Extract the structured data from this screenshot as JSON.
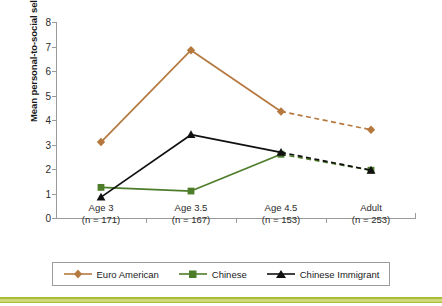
{
  "chart_data": {
    "type": "line",
    "title": "",
    "xlabel": "",
    "ylabel": "Mean personal-to-social self-description ratio",
    "categories": [
      "Age 3",
      "Age 3.5",
      "Age 4.5",
      "Adult"
    ],
    "category_sublabels": [
      "(n = 171)",
      "(n = 167)",
      "(n = 153)",
      "(n = 253)"
    ],
    "ylim": [
      0,
      8
    ],
    "yticks": [
      0,
      1,
      2,
      3,
      4,
      5,
      6,
      7,
      8
    ],
    "ytick_labels": [
      "0",
      "1",
      "2",
      "3",
      "4",
      "5",
      "6",
      "7",
      "8"
    ],
    "grid": false,
    "legend_position": "bottom",
    "series": [
      {
        "name": "Euro American",
        "color": "#b5793f",
        "marker": "diamond",
        "values": [
          3.1,
          6.85,
          4.35,
          3.6
        ],
        "dashed_from_index": 2
      },
      {
        "name": "Chinese",
        "color": "#4e7d2a",
        "marker": "square",
        "values": [
          1.25,
          1.1,
          2.6,
          1.95
        ],
        "dashed_from_index": 2
      },
      {
        "name": "Chinese Immigrant",
        "color": "#111111",
        "marker": "triangle",
        "values": [
          0.85,
          3.4,
          2.68,
          1.95
        ],
        "dashed_from_index": 2
      }
    ]
  },
  "legend": {
    "items": [
      {
        "label": "Euro American",
        "marker": "diamond-marker",
        "color": "#b5793f"
      },
      {
        "label": "Chinese",
        "marker": "square-marker",
        "color": "#4e7d2a"
      },
      {
        "label": "Chinese Immigrant",
        "marker": "triangle-marker",
        "color": "#111111"
      }
    ]
  },
  "colors": {
    "axis": "#9a9a9a",
    "text": "#2b2b2b",
    "bottom_bar": "#a8bc3a"
  }
}
